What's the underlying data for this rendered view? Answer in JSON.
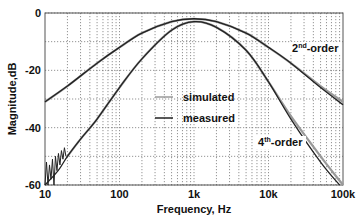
{
  "chart_data": {
    "type": "line",
    "title": "",
    "xlabel": "Frequency, Hz",
    "ylabel": "Magnitude,dB",
    "xscale": "log",
    "xlim": [
      10,
      100000
    ],
    "ylim": [
      -60,
      0
    ],
    "grid": true,
    "x_tick_labels": [
      "10",
      "100",
      "1k",
      "10k",
      "100k"
    ],
    "y_tick_labels": [
      "0",
      "-20",
      "-40",
      "-60"
    ],
    "y_gridlines": [
      0,
      -10,
      -20,
      -30,
      -40,
      -50,
      -60
    ],
    "legend": {
      "position": "center",
      "entries": [
        {
          "label": "simulated",
          "color": "#9a9a9a"
        },
        {
          "label": "measured",
          "color": "#222222"
        }
      ]
    },
    "annotations": [
      {
        "text": "2nd-order",
        "base": "2",
        "sup": "nd",
        "rest": "-order"
      },
      {
        "text": "4th-order",
        "base": "4",
        "sup": "th",
        "rest": "-order"
      }
    ],
    "series": [
      {
        "name": "2nd-order simulated",
        "x": [
          10,
          20,
          50,
          100,
          200,
          500,
          1000,
          2000,
          5000,
          10000,
          20000,
          50000,
          100000
        ],
        "y": [
          -31,
          -25.5,
          -17.5,
          -12,
          -7,
          -3,
          -2,
          -3,
          -7,
          -12,
          -17.5,
          -25.5,
          -31
        ]
      },
      {
        "name": "2nd-order measured",
        "x": [
          10,
          20,
          50,
          100,
          200,
          500,
          1000,
          2000,
          5000,
          10000,
          20000,
          50000,
          100000
        ],
        "y": [
          -31,
          -25.5,
          -17.5,
          -12,
          -7,
          -3,
          -2,
          -3,
          -7,
          -12,
          -17.5,
          -26,
          -32
        ]
      },
      {
        "name": "4th-order simulated",
        "x": [
          20,
          30,
          50,
          100,
          200,
          500,
          1000,
          2000,
          5000,
          10000,
          20000,
          50000,
          100000
        ],
        "y": [
          -50,
          -44,
          -37,
          -26,
          -16,
          -6,
          -3,
          -5,
          -13,
          -24,
          -36,
          -50,
          -60
        ]
      },
      {
        "name": "4th-order measured",
        "x": [
          10,
          15,
          20,
          30,
          50,
          100,
          200,
          500,
          1000,
          2000,
          5000,
          10000,
          20000,
          50000,
          90000
        ],
        "y": [
          -60,
          -55,
          -50,
          -44,
          -37,
          -26,
          -16,
          -6,
          -3,
          -5,
          -13,
          -24,
          -37,
          -52,
          -60
        ]
      }
    ]
  }
}
